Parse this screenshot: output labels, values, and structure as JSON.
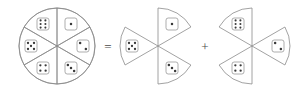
{
  "figure": {
    "background_color": "#ffffff",
    "stroke_color": "#8a8a8a",
    "pip_color": "#3a3a3a",
    "die_face_fill": "#ffffff",
    "operators": [
      {
        "name": "equals",
        "symbol": "=",
        "x": 108,
        "y": 48
      },
      {
        "name": "plus",
        "symbol": "+",
        "x": 205,
        "y": 48
      }
    ],
    "whole": {
      "label": "whole-circle",
      "shape": "circle",
      "center_x": 57,
      "center_y": 46,
      "radius": 38,
      "sector_count": 6,
      "sectors": [
        {
          "position": "top-left",
          "pips": 6,
          "die_x": 43,
          "die_y": 24
        },
        {
          "position": "top-right",
          "pips": 1,
          "die_x": 71,
          "die_y": 24
        },
        {
          "position": "left",
          "pips": 5,
          "die_x": 31,
          "die_y": 46
        },
        {
          "position": "right",
          "pips": 2,
          "die_x": 83,
          "die_y": 46
        },
        {
          "position": "bottom-left",
          "pips": 4,
          "die_x": 43,
          "die_y": 68
        },
        {
          "position": "bottom-right",
          "pips": 3,
          "die_x": 71,
          "die_y": 68
        }
      ]
    },
    "part_one": {
      "label": "first-fan",
      "shape": "three-sector-fan",
      "center_x": 158,
      "center_y": 46,
      "radius": 38,
      "sector_count": 3,
      "sectors": [
        {
          "position": "top-right",
          "pips": 1,
          "die_x": 172,
          "die_y": 24
        },
        {
          "position": "left",
          "pips": 5,
          "die_x": 132,
          "die_y": 46
        },
        {
          "position": "bottom-right",
          "pips": 3,
          "die_x": 172,
          "die_y": 68
        }
      ]
    },
    "part_two": {
      "label": "second-fan",
      "shape": "three-sector-fan",
      "center_x": 252,
      "center_y": 46,
      "radius": 38,
      "sector_count": 3,
      "sectors": [
        {
          "position": "top-left",
          "pips": 6,
          "die_x": 238,
          "die_y": 24
        },
        {
          "position": "right",
          "pips": 2,
          "die_x": 278,
          "die_y": 46
        },
        {
          "position": "bottom-left",
          "pips": 4,
          "die_x": 238,
          "die_y": 68
        }
      ]
    }
  }
}
